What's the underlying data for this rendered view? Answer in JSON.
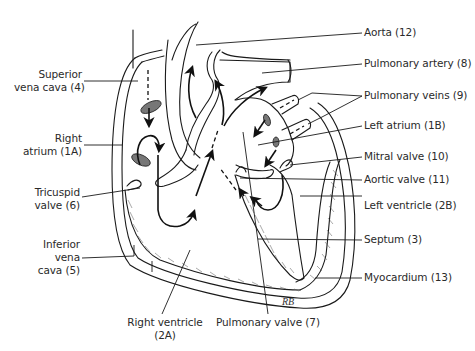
{
  "diagram": {
    "labels_left": [
      {
        "id": "superior-vena-cava",
        "lines": [
          "Superior",
          "vena cava (4)"
        ]
      },
      {
        "id": "right-atrium",
        "lines": [
          "Right",
          "atrium (1A)"
        ]
      },
      {
        "id": "tricuspid-valve",
        "lines": [
          "Tricuspid",
          "valve (6)"
        ]
      },
      {
        "id": "inferior-vena-cava",
        "lines": [
          "Inferior",
          "vena",
          "cava (5)"
        ]
      }
    ],
    "labels_right": [
      {
        "id": "aorta",
        "text": "Aorta (12)"
      },
      {
        "id": "pulmonary-artery",
        "text": "Pulmonary artery (8)"
      },
      {
        "id": "pulmonary-veins",
        "text": "Pulmonary veins (9)"
      },
      {
        "id": "left-atrium",
        "text": "Left atrium (1B)"
      },
      {
        "id": "mitral-valve",
        "text": "Mitral valve (10)"
      },
      {
        "id": "aortic-valve",
        "text": "Aortic valve (11)"
      },
      {
        "id": "left-ventricle",
        "text": "Left ventricle (2B)"
      },
      {
        "id": "septum",
        "text": "Septum (3)"
      },
      {
        "id": "myocardium",
        "text": "Myocardium (13)"
      }
    ],
    "labels_bottom": [
      {
        "id": "right-ventricle",
        "lines": [
          "Right ventricle",
          "(2A)"
        ]
      },
      {
        "id": "pulmonary-valve",
        "text": "Pulmonary valve (7)"
      }
    ],
    "signature": "RB"
  }
}
